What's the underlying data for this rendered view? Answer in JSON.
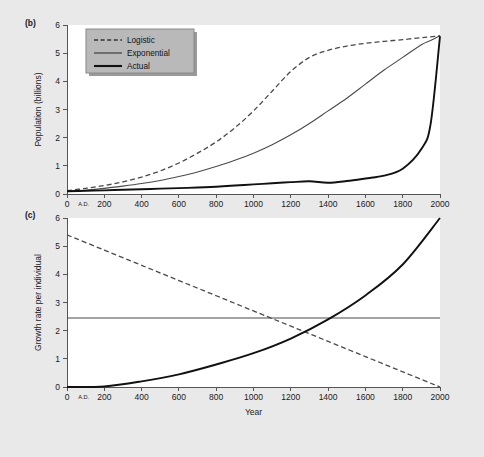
{
  "figure": {
    "background_color": "#e9e9e9",
    "plot_background_color": "#ffffff",
    "panel_b_label": "(b)",
    "panel_c_label": "(c)"
  },
  "legend": {
    "position": "top-left-inside-panel-b",
    "background_color": "#b9b9b9",
    "entries": [
      {
        "label": "Logistic",
        "style": "dashed"
      },
      {
        "label": "Exponential",
        "style": "thin-solid"
      },
      {
        "label": "Actual",
        "style": "thick-solid"
      }
    ]
  },
  "chart_data": [
    {
      "type": "line",
      "panel": "(b)",
      "title": "",
      "xlabel": "",
      "ylabel": "Population (billions)",
      "xlim": [
        0,
        2000
      ],
      "ylim": [
        0,
        6
      ],
      "grid": false,
      "xticks": [
        0,
        200,
        400,
        600,
        800,
        1000,
        1200,
        1400,
        1600,
        1800,
        2000
      ],
      "xtick_labels": [
        "0",
        "200",
        "400",
        "600",
        "800",
        "1000",
        "1200",
        "1400",
        "1600",
        "1800",
        "2000"
      ],
      "x_era_label": "A.D.",
      "yticks": [
        0,
        1,
        2,
        3,
        4,
        5,
        6
      ],
      "ytick_labels": [
        "0",
        "1",
        "2",
        "3",
        "4",
        "5",
        "6"
      ],
      "x": [
        0,
        100,
        200,
        300,
        400,
        500,
        600,
        700,
        800,
        900,
        1000,
        1100,
        1200,
        1300,
        1400,
        1500,
        1600,
        1700,
        1800,
        1900,
        1950,
        2000
      ],
      "series": [
        {
          "name": "Logistic",
          "style": "dashed",
          "values": [
            0.12,
            0.2,
            0.3,
            0.43,
            0.6,
            0.82,
            1.1,
            1.45,
            1.85,
            2.35,
            2.95,
            3.65,
            4.35,
            4.85,
            5.1,
            5.25,
            5.35,
            5.42,
            5.48,
            5.55,
            5.58,
            5.62
          ]
        },
        {
          "name": "Exponential",
          "style": "thin-solid",
          "values": [
            0.1,
            0.14,
            0.2,
            0.28,
            0.37,
            0.48,
            0.62,
            0.78,
            0.98,
            1.2,
            1.45,
            1.75,
            2.1,
            2.5,
            2.95,
            3.4,
            3.9,
            4.4,
            4.85,
            5.3,
            5.45,
            5.62
          ]
        },
        {
          "name": "Actual",
          "style": "thick-solid",
          "values": [
            0.1,
            0.11,
            0.13,
            0.15,
            0.17,
            0.19,
            0.21,
            0.23,
            0.26,
            0.3,
            0.34,
            0.38,
            0.42,
            0.45,
            0.4,
            0.46,
            0.55,
            0.65,
            0.9,
            1.6,
            2.5,
            5.6
          ]
        }
      ]
    },
    {
      "type": "line",
      "panel": "(c)",
      "title": "",
      "xlabel": "Year",
      "ylabel": "Growth rate per individual",
      "xlim": [
        0,
        2000
      ],
      "ylim": [
        0,
        6
      ],
      "grid": false,
      "xticks": [
        0,
        200,
        400,
        600,
        800,
        1000,
        1200,
        1400,
        1600,
        1800,
        2000
      ],
      "xtick_labels": [
        "0",
        "200",
        "400",
        "600",
        "800",
        "1000",
        "1200",
        "1400",
        "1600",
        "1800",
        "2000"
      ],
      "x_era_label": "A.D.",
      "yticks": [
        0,
        1,
        2,
        3,
        4,
        5,
        6
      ],
      "ytick_labels": [
        "0",
        "1",
        "2",
        "3",
        "4",
        "5",
        "6"
      ],
      "x": [
        0,
        200,
        400,
        600,
        800,
        1000,
        1200,
        1400,
        1600,
        1800,
        2000
      ],
      "series": [
        {
          "name": "Logistic",
          "style": "dashed",
          "values": [
            5.4,
            4.86,
            4.32,
            3.78,
            3.24,
            2.7,
            2.16,
            1.62,
            1.08,
            0.54,
            0.0
          ]
        },
        {
          "name": "Exponential",
          "style": "thin-solid",
          "values": [
            2.45,
            2.45,
            2.45,
            2.45,
            2.45,
            2.45,
            2.45,
            2.45,
            2.45,
            2.45,
            2.45
          ]
        },
        {
          "name": "Actual",
          "style": "thick-solid",
          "values": [
            0.0,
            0.02,
            0.2,
            0.45,
            0.8,
            1.2,
            1.72,
            2.4,
            3.25,
            4.35,
            6.0
          ]
        }
      ]
    }
  ]
}
